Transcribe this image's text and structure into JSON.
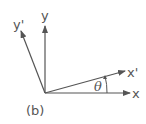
{
  "diagram": {
    "caption": "(b)",
    "colors": {
      "stroke": "#555555",
      "background": "#ffffff"
    },
    "axes": [
      {
        "name": "x",
        "label": "x"
      },
      {
        "name": "y",
        "label": "y"
      },
      {
        "name": "x-prime",
        "label": "x'"
      },
      {
        "name": "y-prime",
        "label": "y'"
      }
    ],
    "angle_label": "θ"
  }
}
